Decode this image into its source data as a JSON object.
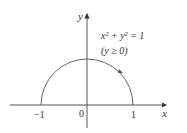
{
  "diagram": {
    "equation": "x² + y² = 1",
    "condition": "(y ≥ 0)",
    "axes": {
      "x_label": "x",
      "y_label": "y"
    },
    "ticks": {
      "neg_one": "−1",
      "zero": "0",
      "one": "1"
    },
    "colors": {
      "stroke": "#444444",
      "text": "#333333",
      "background": "#ffffff"
    }
  }
}
